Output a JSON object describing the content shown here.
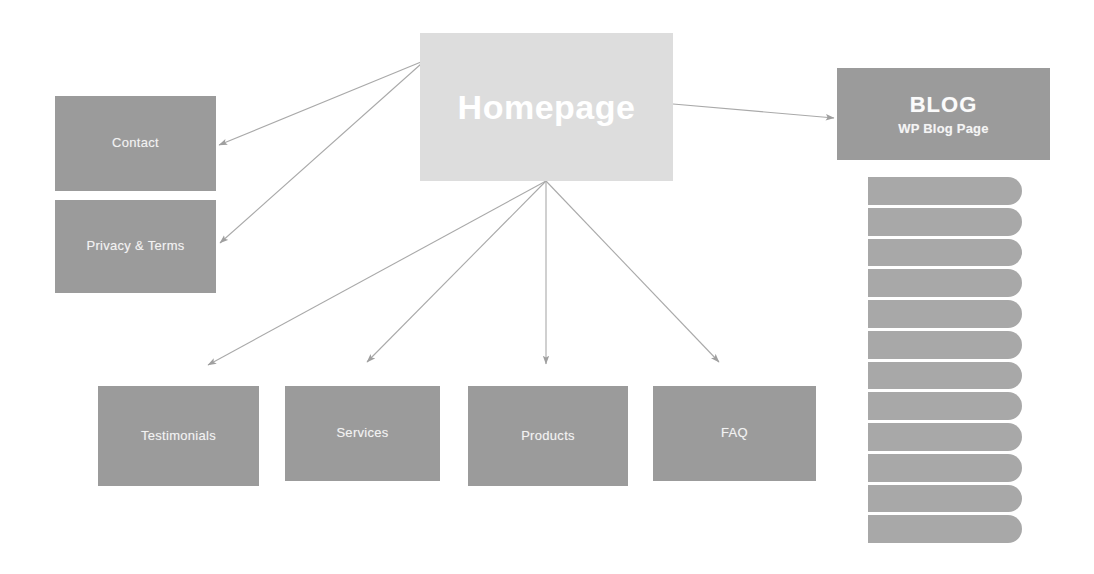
{
  "diagram": {
    "background_color": "#ffffff",
    "node_color": "#9b9b9b",
    "root_color": "#dddddd",
    "pill_color": "#a8a8a8",
    "connector_color": "#a9a9a9",
    "text_color": "#f2f2f2"
  },
  "nodes": {
    "homepage": {
      "label": "Homepage"
    },
    "contact": {
      "label": "Contact"
    },
    "privacy_terms": {
      "label": "Privacy & Terms"
    },
    "blog": {
      "title": "BLOG",
      "subtitle": "WP Blog Page"
    },
    "testimonials": {
      "label": "Testimonials"
    },
    "services": {
      "label": "Services"
    },
    "products": {
      "label": "Products"
    },
    "faq": {
      "label": "FAQ"
    }
  },
  "blog_posts": {
    "count": 12,
    "items": [
      {
        "label": ""
      },
      {
        "label": ""
      },
      {
        "label": ""
      },
      {
        "label": ""
      },
      {
        "label": ""
      },
      {
        "label": ""
      },
      {
        "label": ""
      },
      {
        "label": ""
      },
      {
        "label": ""
      },
      {
        "label": ""
      },
      {
        "label": ""
      },
      {
        "label": ""
      }
    ]
  },
  "connections": [
    {
      "from": "homepage",
      "to": "contact"
    },
    {
      "from": "homepage",
      "to": "privacy_terms"
    },
    {
      "from": "homepage",
      "to": "blog"
    },
    {
      "from": "homepage",
      "to": "testimonials"
    },
    {
      "from": "homepage",
      "to": "services"
    },
    {
      "from": "homepage",
      "to": "products"
    },
    {
      "from": "homepage",
      "to": "faq"
    }
  ]
}
